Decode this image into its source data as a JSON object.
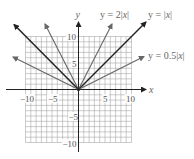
{
  "chart_data": {
    "type": "line",
    "title": "",
    "xlabel": "x",
    "ylabel": "y",
    "xlim": [
      -10,
      10
    ],
    "ylim": [
      -10,
      10
    ],
    "grid": true,
    "grid_step": 1,
    "x_ticks": [
      -10,
      -5,
      5,
      10
    ],
    "y_ticks": [
      10,
      5,
      -5,
      -10
    ],
    "x_tick_labels": [
      "−10",
      "−5",
      "5",
      "10"
    ],
    "y_tick_labels": [
      "10",
      "5",
      "−5",
      "−10"
    ],
    "series": [
      {
        "name": "y = 2|x|",
        "formula": "2*abs(x)",
        "slope": 2,
        "x": [
          -6.2,
          0,
          6.2
        ],
        "y": [
          12.4,
          0,
          12.4
        ],
        "color": "#666666",
        "emphasis": false
      },
      {
        "name": "y = |x|",
        "formula": "abs(x)",
        "slope": 1,
        "x": [
          -12.2,
          0,
          12.7
        ],
        "y": [
          12.2,
          0,
          12.7
        ],
        "color": "#222222",
        "emphasis": true
      },
      {
        "name": "y = 0.5|x|",
        "formula": "0.5*abs(x)",
        "slope": 0.5,
        "x": [
          -12.3,
          0,
          12.3
        ],
        "y": [
          6.15,
          0,
          6.15
        ],
        "color": "#666666",
        "emphasis": false
      }
    ],
    "annotations": [
      {
        "text": "y = 2|x|",
        "near": "upper-right of steep line"
      },
      {
        "text": "y = |x|",
        "near": "upper-right of 45-degree line"
      },
      {
        "text": "y = 0.5|x|",
        "near": "right end of shallow line"
      }
    ],
    "legend": "inline labels"
  },
  "axes": {
    "x_label": "x",
    "y_label": "y"
  },
  "labels": {
    "two_abs": {
      "pre": "y = 2|",
      "var": "x",
      "post": "|"
    },
    "abs": {
      "pre": "y = |",
      "var": "x",
      "post": "|"
    },
    "half_abs": {
      "pre": "y = 0.5|",
      "var": "x",
      "post": "|"
    }
  },
  "ticks": {
    "x_m10": "−10",
    "x_m5": "−5",
    "x_5": "5",
    "x_10": "10",
    "y_10": "10",
    "y_5": "5",
    "y_m5": "−5",
    "y_m10": "−10"
  },
  "colors": {
    "grid": "#9a9a9a",
    "axis": "#222222",
    "line_dark": "#222222",
    "line_gray": "#666666"
  }
}
